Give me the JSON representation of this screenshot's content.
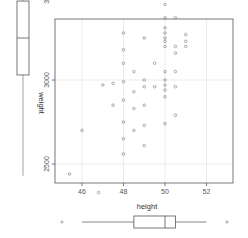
{
  "chart_data": [
    {
      "type": "scatter",
      "title": "",
      "xlabel": "height",
      "ylabel": "weight",
      "xlim": [
        45.3,
        53.5
      ],
      "ylim": [
        2380,
        4230
      ],
      "x_ticks": [
        46,
        48,
        50,
        52
      ],
      "x_tick_labels": [
        "46",
        "48",
        "50",
        "52"
      ],
      "y_ticks": [
        2500,
        3000,
        3500,
        4000
      ],
      "y_tick_labels": [
        "2500",
        "3000",
        "3500",
        "4000"
      ],
      "grid": true,
      "legend": null,
      "points": [
        {
          "x": 45.4,
          "y": 2440
        },
        {
          "x": 46.8,
          "y": 2330
        },
        {
          "x": 46.0,
          "y": 2700
        },
        {
          "x": 47.0,
          "y": 2970
        },
        {
          "x": 47.5,
          "y": 2980
        },
        {
          "x": 47.5,
          "y": 2850
        },
        {
          "x": 48.0,
          "y": 3280
        },
        {
          "x": 48.0,
          "y": 3180
        },
        {
          "x": 48.0,
          "y": 3100
        },
        {
          "x": 48.0,
          "y": 2990
        },
        {
          "x": 48.0,
          "y": 2880
        },
        {
          "x": 48.0,
          "y": 2750
        },
        {
          "x": 48.0,
          "y": 2650
        },
        {
          "x": 48.0,
          "y": 2560
        },
        {
          "x": 48.5,
          "y": 3050
        },
        {
          "x": 48.5,
          "y": 2930
        },
        {
          "x": 48.5,
          "y": 2830
        },
        {
          "x": 48.5,
          "y": 2700
        },
        {
          "x": 49.0,
          "y": 3250
        },
        {
          "x": 49.0,
          "y": 3000
        },
        {
          "x": 49.0,
          "y": 2960
        },
        {
          "x": 49.0,
          "y": 2850
        },
        {
          "x": 49.0,
          "y": 2730
        },
        {
          "x": 49.0,
          "y": 2610
        },
        {
          "x": 49.5,
          "y": 3620
        },
        {
          "x": 49.5,
          "y": 3100
        },
        {
          "x": 49.5,
          "y": 2960
        },
        {
          "x": 50.0,
          "y": 3800
        },
        {
          "x": 50.0,
          "y": 3570
        },
        {
          "x": 50.0,
          "y": 3500
        },
        {
          "x": 50.0,
          "y": 3450
        },
        {
          "x": 50.0,
          "y": 3370
        },
        {
          "x": 50.0,
          "y": 3310
        },
        {
          "x": 50.0,
          "y": 3280
        },
        {
          "x": 50.0,
          "y": 3250
        },
        {
          "x": 50.0,
          "y": 3230
        },
        {
          "x": 50.0,
          "y": 3200
        },
        {
          "x": 50.0,
          "y": 3050
        },
        {
          "x": 50.0,
          "y": 3000
        },
        {
          "x": 50.0,
          "y": 2970
        },
        {
          "x": 50.0,
          "y": 2940
        },
        {
          "x": 50.0,
          "y": 2900
        },
        {
          "x": 50.0,
          "y": 2740
        },
        {
          "x": 50.5,
          "y": 3570
        },
        {
          "x": 50.5,
          "y": 3510
        },
        {
          "x": 50.5,
          "y": 3370
        },
        {
          "x": 50.5,
          "y": 3200
        },
        {
          "x": 50.5,
          "y": 3160
        },
        {
          "x": 50.5,
          "y": 3050
        },
        {
          "x": 50.5,
          "y": 2960
        },
        {
          "x": 50.5,
          "y": 2790
        },
        {
          "x": 51.0,
          "y": 3660
        },
        {
          "x": 51.0,
          "y": 3490
        },
        {
          "x": 51.0,
          "y": 3270
        },
        {
          "x": 51.0,
          "y": 3230
        },
        {
          "x": 51.0,
          "y": 3200
        },
        {
          "x": 52.0,
          "y": 3890
        },
        {
          "x": 53.0,
          "y": 4110
        },
        {
          "x": 53.0,
          "y": 4180
        }
      ]
    },
    {
      "type": "boxplot",
      "variable": "weight",
      "orientation": "vertical",
      "position": "left",
      "label": "weight",
      "stats": {
        "lower_whisker": 2430,
        "q1": 3030,
        "median": 3250,
        "q3": 3470,
        "upper_whisker": 4120,
        "outliers": [
          4210
        ]
      }
    },
    {
      "type": "boxplot",
      "variable": "height",
      "orientation": "horizontal",
      "position": "bottom",
      "label": "height",
      "stats": {
        "lower_whisker": 46,
        "q1": 48.5,
        "median": 50,
        "q3": 50.5,
        "upper_whisker": 52,
        "outliers": [
          45,
          53
        ]
      }
    }
  ],
  "colors": {
    "point": "#888888",
    "axis": "#555555",
    "grid": "#e6e6e6",
    "box": "#555555",
    "whisker": "#999999"
  }
}
